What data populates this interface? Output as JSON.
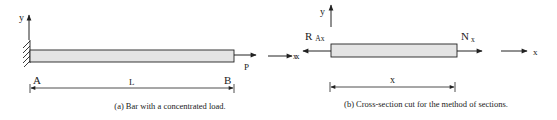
{
  "panel_a": {
    "caption": "(a) Bar with a concentrated load.",
    "y_axis_label": "y",
    "x_axis_label": "x",
    "point_a": "A",
    "point_b": "B",
    "length_label": "L",
    "load_label": "P"
  },
  "panel_b": {
    "caption": "(b) Cross-section cut for the method of sections.",
    "y_axis_label": "y",
    "x_axis_label": "x",
    "reaction_label": "R",
    "reaction_subscript": "Ax",
    "normal_force_label": "N",
    "normal_force_subscript": "x",
    "length_label": "x"
  },
  "colors": {
    "bar_fill": "#e4e4e4",
    "line": "#222222"
  }
}
